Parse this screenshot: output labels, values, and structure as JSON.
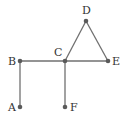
{
  "graph": {
    "nodes": [
      {
        "id": "A",
        "label": "A",
        "x": 20,
        "y": 107
      },
      {
        "id": "B",
        "label": "B",
        "x": 20,
        "y": 61
      },
      {
        "id": "C",
        "label": "C",
        "x": 65,
        "y": 61
      },
      {
        "id": "D",
        "label": "D",
        "x": 86,
        "y": 21
      },
      {
        "id": "E",
        "label": "E",
        "x": 108,
        "y": 61
      },
      {
        "id": "F",
        "label": "F",
        "x": 65,
        "y": 107
      }
    ],
    "edges": [
      [
        "A",
        "B"
      ],
      [
        "B",
        "C"
      ],
      [
        "C",
        "E"
      ],
      [
        "C",
        "D"
      ],
      [
        "D",
        "E"
      ],
      [
        "C",
        "F"
      ]
    ],
    "colors": {
      "edge": "#707070",
      "node": "#5a5a5a",
      "label": "#333333"
    }
  }
}
